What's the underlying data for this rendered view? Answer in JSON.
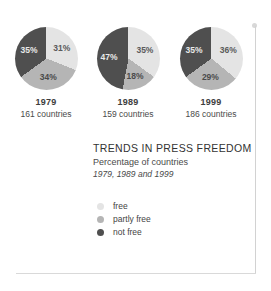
{
  "figure": {
    "title": "TRENDS IN PRESS FREEDOM",
    "subtitle": "Percentage of countries",
    "subtitle_years": "1979, 1989 and 1999"
  },
  "legend": {
    "items": [
      {
        "label": "free",
        "color": "#e4e4e4",
        "key": "free"
      },
      {
        "label": "partly free",
        "color": "#b5b5b5",
        "key": "partly-free"
      },
      {
        "label": "not free",
        "color": "#4f4f4f",
        "key": "not-free"
      }
    ]
  },
  "pies": [
    {
      "year": "1979",
      "count": "161 countries",
      "labels": {
        "free": "31%",
        "partly_free": "34%",
        "not_free": "35%"
      }
    },
    {
      "year": "1989",
      "count": "159 countries",
      "labels": {
        "free": "35%",
        "partly_free": "18%",
        "not_free": "47%"
      }
    },
    {
      "year": "1999",
      "count": "186 countries",
      "labels": {
        "free": "36%",
        "partly_free": "29%",
        "not_free": "35%"
      }
    }
  ],
  "chart_data": {
    "type": "pie",
    "title": "TRENDS IN PRESS FREEDOM",
    "subtitle": "Percentage of countries",
    "annotation": "1979, 1989 and 1999",
    "categories": [
      "free",
      "partly free",
      "not free"
    ],
    "colors": [
      "#e4e4e4",
      "#b5b5b5",
      "#4f4f4f"
    ],
    "legend_position": "below-title",
    "unit": "percent",
    "charts": [
      {
        "name": "1979",
        "subcaption": "161 countries",
        "total_countries": 161,
        "values": [
          31,
          34,
          35
        ]
      },
      {
        "name": "1989",
        "subcaption": "159 countries",
        "total_countries": 159,
        "values": [
          35,
          18,
          47
        ]
      },
      {
        "name": "1999",
        "subcaption": "186 countries",
        "total_countries": 186,
        "values": [
          36,
          29,
          35
        ]
      }
    ]
  }
}
